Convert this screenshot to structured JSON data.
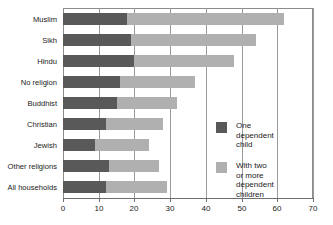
{
  "chart_data": {
    "type": "bar",
    "orientation": "horizontal",
    "stacked": true,
    "title": "",
    "xlabel": "",
    "ylabel": "",
    "xlim": [
      0,
      70
    ],
    "xticks": [
      0,
      10,
      20,
      30,
      40,
      50,
      60,
      70
    ],
    "xtick_labels": [
      "0",
      "10",
      "20",
      "30",
      "40",
      "50",
      "60",
      "70"
    ],
    "grid": "vertical",
    "legend_position": "inside-right",
    "categories": [
      "Muslim",
      "Sikh",
      "Hindu",
      "No religion",
      "Buddhist",
      "Christian",
      "Jewish",
      "Other religions",
      "All households"
    ],
    "series": [
      {
        "name": "One dependent child",
        "color": "#595959",
        "values": [
          18,
          19,
          20,
          16,
          15,
          12,
          9,
          13,
          12
        ]
      },
      {
        "name": "With two or more dependent children",
        "color": "#b0b0b0",
        "values": [
          44,
          35,
          28,
          21,
          17,
          16,
          15,
          14,
          17
        ]
      }
    ],
    "totals": [
      62,
      54,
      48,
      37,
      32,
      28,
      24,
      27,
      29
    ]
  },
  "legend": {
    "items": [
      {
        "label": "One dependent\nchild",
        "swatch": "one"
      },
      {
        "label": "With two\nor more\ndependent children",
        "swatch": "two"
      }
    ]
  },
  "colors": {
    "one_dependent_child": "#595959",
    "two_or_more_children": "#b0b0b0",
    "axis": "#6e6e6e",
    "gridline": "#9a9a9a",
    "text": "#1b1b1b",
    "background": "#ffffff"
  }
}
